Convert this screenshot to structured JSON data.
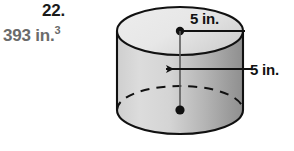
{
  "problem": {
    "number": "22.",
    "answer": "393 in.",
    "answer_exponent": "3"
  },
  "figure": {
    "shape_name": "cylinder",
    "radius_label": "5 in.",
    "height_label": "5 in.",
    "colors": {
      "top_face_fill": "#e9e9e9",
      "body_fill_light": "#d6d6d6",
      "body_fill_dark": "#9b9b9b",
      "outline": "#111111",
      "answer_text": "#6b6b6b",
      "number_text": "#1a1a1a",
      "background": "#ffffff"
    },
    "geometry": {
      "center_x": 180,
      "top_ellipse_cy": 31,
      "bottom_ellipse_cy": 110,
      "rx": 63,
      "ry": 24
    }
  }
}
